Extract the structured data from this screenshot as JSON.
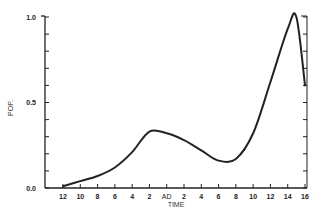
{
  "chart_data": {
    "type": "line",
    "title": "",
    "xlabel": "TIME",
    "ylabel": "POP.",
    "x": [
      "12",
      "10",
      "8",
      "6",
      "4",
      "2",
      "AD",
      "2",
      "4",
      "6",
      "8",
      "10",
      "12",
      "14",
      "15",
      "16"
    ],
    "x_numeric": [
      -12,
      -10,
      -8,
      -6,
      -4,
      -2,
      0,
      2,
      4,
      6,
      8,
      10,
      12,
      14,
      15,
      16
    ],
    "series": [
      {
        "name": "POP.",
        "values": [
          0.01,
          0.04,
          0.07,
          0.12,
          0.21,
          0.33,
          0.32,
          0.28,
          0.22,
          0.16,
          0.17,
          0.32,
          0.62,
          0.93,
          1.0,
          0.6
        ]
      }
    ],
    "x_tick_labels": [
      "12",
      "10",
      "8",
      "6",
      "4",
      "2",
      "AD",
      "2",
      "4",
      "6",
      "8",
      "10",
      "12",
      "14",
      "16"
    ],
    "y_tick_labels": [
      "0.0",
      "0.5",
      "1.0"
    ],
    "ylim": [
      0,
      1.0
    ],
    "xlim": [
      -12,
      16
    ],
    "grid": false,
    "legend": "none"
  },
  "axes": {
    "ylabel": "POP.",
    "xlabel": "TIME",
    "y_ticks": [
      "0.0",
      "0.5",
      "1.0"
    ],
    "x_ticks": [
      "12",
      "10",
      "8",
      "6",
      "4",
      "2",
      "AD",
      "2",
      "4",
      "6",
      "8",
      "10",
      "12",
      "14",
      "16"
    ]
  },
  "colors": {
    "line": "#222222",
    "axis": "#222222",
    "background": "#ffffff"
  }
}
